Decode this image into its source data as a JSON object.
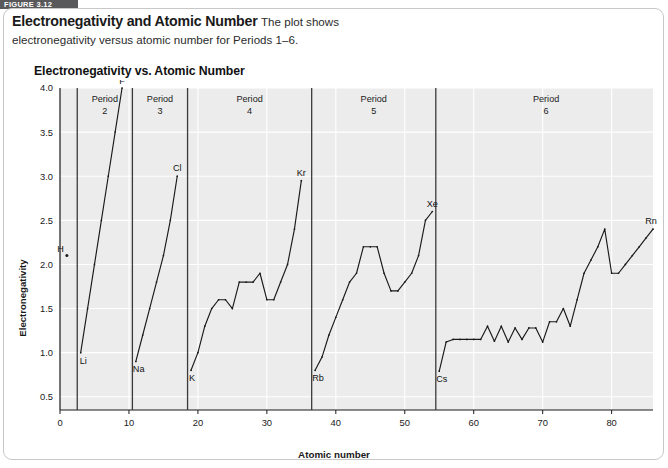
{
  "figure": {
    "tab_label": "FIGURE 3.12"
  },
  "caption": {
    "title": "Electronegativity and Atomic Number",
    "body_line1": "The plot shows",
    "body_line2": "electronegativity versus atomic number for Periods 1–6."
  },
  "plot": {
    "title": "Electronegativity vs. Atomic Number"
  },
  "colors": {
    "plot_background": "#ececec",
    "gridline": "#ffffff",
    "line": "#1a1a1a",
    "divider": "#3a3a3a",
    "tab_background": "#59595b",
    "card_border": "#c8c8c8"
  },
  "chart_data": {
    "type": "line",
    "title": "Electronegativity vs. Atomic Number",
    "xlabel": "Atomic number",
    "ylabel": "Electronegativity",
    "xlim": [
      0,
      86
    ],
    "ylim": [
      0.35,
      4.0
    ],
    "xticks": [
      0,
      10,
      20,
      30,
      40,
      50,
      60,
      70,
      80
    ],
    "yticks": [
      0.5,
      1.0,
      1.5,
      2.0,
      2.5,
      3.0,
      3.5,
      4.0
    ],
    "grid": true,
    "legend": "none",
    "period_dividers": [
      2.5,
      10.5,
      18.5,
      36.5,
      54.5
    ],
    "period_labels": [
      {
        "text": "Period",
        "number": "2",
        "x": 6.5
      },
      {
        "text": "Period",
        "number": "3",
        "x": 14.5
      },
      {
        "text": "Period",
        "number": "4",
        "x": 27.5
      },
      {
        "text": "Period",
        "number": "5",
        "x": 45.5
      },
      {
        "text": "Period",
        "number": "6",
        "x": 70.5
      }
    ],
    "point_markers": [
      {
        "label": "H",
        "x": 1,
        "y": 2.1,
        "label_dx": -9,
        "label_dy": -5
      }
    ],
    "series": [
      {
        "name": "Period 1",
        "points": [
          [
            1,
            2.1
          ]
        ]
      },
      {
        "name": "Period 2",
        "x": [
          3,
          4,
          5,
          6,
          7,
          8,
          9
        ],
        "values": [
          1.0,
          1.5,
          2.0,
          2.5,
          3.0,
          3.5,
          4.0
        ]
      },
      {
        "name": "Period 3",
        "x": [
          11,
          12,
          13,
          14,
          15,
          16,
          17
        ],
        "values": [
          0.9,
          1.2,
          1.5,
          1.8,
          2.1,
          2.5,
          3.0
        ]
      },
      {
        "name": "Period 4",
        "x": [
          19,
          20,
          21,
          22,
          23,
          24,
          25,
          26,
          27,
          28,
          29,
          30,
          31,
          32,
          33,
          34,
          35
        ],
        "values": [
          0.8,
          1.0,
          1.3,
          1.5,
          1.6,
          1.6,
          1.5,
          1.8,
          1.8,
          1.8,
          1.9,
          1.6,
          1.6,
          1.8,
          2.0,
          2.4,
          2.95
        ]
      },
      {
        "name": "Period 5",
        "x": [
          37,
          38,
          39,
          40,
          41,
          42,
          43,
          44,
          45,
          46,
          47,
          48,
          49,
          50,
          51,
          52,
          53,
          54
        ],
        "values": [
          0.8,
          0.95,
          1.2,
          1.4,
          1.6,
          1.8,
          1.9,
          2.2,
          2.2,
          2.2,
          1.9,
          1.7,
          1.7,
          1.8,
          1.9,
          2.1,
          2.5,
          2.6
        ]
      },
      {
        "name": "Period 6",
        "x": [
          55,
          56,
          57,
          58,
          59,
          60,
          61,
          62,
          63,
          64,
          65,
          66,
          67,
          68,
          69,
          70,
          71,
          72,
          73,
          74,
          75,
          76,
          77,
          78,
          79,
          80,
          81,
          82,
          83,
          84,
          85,
          86
        ],
        "values": [
          0.79,
          1.12,
          1.15,
          1.15,
          1.15,
          1.15,
          1.15,
          1.3,
          1.13,
          1.3,
          1.12,
          1.28,
          1.15,
          1.28,
          1.28,
          1.12,
          1.35,
          1.35,
          1.5,
          1.3,
          1.6,
          1.9,
          2.05,
          2.2,
          2.4,
          1.9,
          1.9,
          2.0,
          2.1,
          2.2,
          2.3,
          2.4
        ]
      }
    ],
    "element_labels": [
      {
        "text": "H",
        "x": 1,
        "y": 2.1,
        "anchor": "end",
        "dx": -3,
        "dy": -4
      },
      {
        "text": "Li",
        "x": 3,
        "y": 1.0,
        "anchor": "start",
        "dx": -1,
        "dy": 11
      },
      {
        "text": "F",
        "x": 9,
        "y": 4.0,
        "anchor": "middle",
        "dx": 0,
        "dy": -4
      },
      {
        "text": "Na",
        "x": 11,
        "y": 0.9,
        "anchor": "start",
        "dx": -3,
        "dy": 11
      },
      {
        "text": "Cl",
        "x": 17,
        "y": 3.0,
        "anchor": "middle",
        "dx": 0,
        "dy": -5
      },
      {
        "text": "K",
        "x": 19,
        "y": 0.8,
        "anchor": "start",
        "dx": -2,
        "dy": 11
      },
      {
        "text": "Kr",
        "x": 35,
        "y": 2.95,
        "anchor": "middle",
        "dx": 0,
        "dy": -5
      },
      {
        "text": "Rb",
        "x": 37,
        "y": 0.8,
        "anchor": "start",
        "dx": -3,
        "dy": 11
      },
      {
        "text": "Xe",
        "x": 54,
        "y": 2.6,
        "anchor": "middle",
        "dx": 0,
        "dy": -5
      },
      {
        "text": "Cs",
        "x": 55,
        "y": 0.79,
        "anchor": "start",
        "dx": -3,
        "dy": 11
      },
      {
        "text": "Rn",
        "x": 86,
        "y": 2.4,
        "anchor": "middle",
        "dx": -2,
        "dy": -5
      }
    ]
  }
}
